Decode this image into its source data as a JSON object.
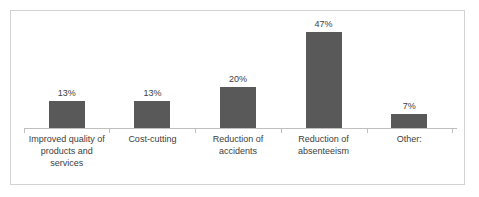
{
  "chart_data": {
    "type": "bar",
    "title": "",
    "subtitle": "",
    "xlabel": "",
    "ylabel": "",
    "categories": [
      "Improved quality of products and services",
      "Cost-cutting",
      "Reduction of accidents",
      "Reduction of absenteeism",
      "Other:"
    ],
    "values": [
      13,
      13,
      20,
      47,
      7
    ],
    "data_labels": [
      "13%",
      "13%",
      "20%",
      "47%",
      "7%"
    ],
    "ylim": [
      0,
      50
    ],
    "grid": false,
    "legend": false,
    "legend_position": "none",
    "bar_color": "#595959",
    "axis_color": "#bfbfbf",
    "frame_color": "#d3d3d3",
    "label_color": "#404040",
    "background": "#ffffff"
  }
}
